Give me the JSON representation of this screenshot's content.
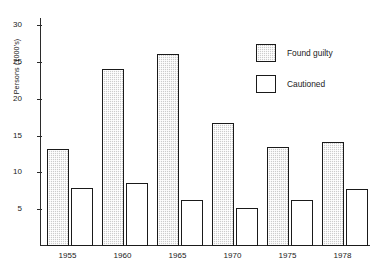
{
  "chart_data": {
    "type": "bar",
    "title": "",
    "subtitle": "",
    "xlabel": "",
    "ylabel": "Persons (1000's)",
    "categories": [
      "1955",
      "1960",
      "1965",
      "1970",
      "1975",
      "1978"
    ],
    "series": [
      {
        "name": "Found guilty",
        "values": [
          13.2,
          24.1,
          26.1,
          16.7,
          13.4,
          14.2
        ],
        "fill": "#cccccc",
        "pattern": "hatched",
        "border": "#1a1a1a"
      },
      {
        "name": "Cautioned",
        "values": [
          7.9,
          8.6,
          6.2,
          5.2,
          6.2,
          7.7
        ],
        "fill": "#ffffff",
        "pattern": "solid",
        "border": "#1a1a1a"
      }
    ],
    "ylim": [
      0,
      31
    ],
    "yticks": [
      5,
      10,
      15,
      20,
      25,
      30
    ],
    "ytick_labels": [
      "5",
      "10",
      "15",
      "20",
      "25",
      "30"
    ],
    "grid": false,
    "legend_position": "upper-right",
    "axis_color": "#2b2b2b",
    "background": "#ffffff"
  },
  "legend": {
    "items": [
      {
        "label": "Found guilty"
      },
      {
        "label": "Cautioned"
      }
    ]
  }
}
